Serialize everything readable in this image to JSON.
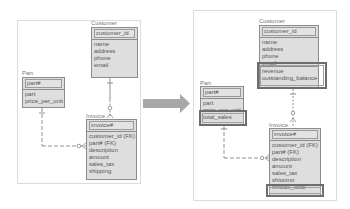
{
  "before": {
    "customer": {
      "title": "Customer",
      "key": "customer_id",
      "attrs": [
        "name",
        "address",
        "phone",
        "email"
      ]
    },
    "part": {
      "title": "Part",
      "key": "part#",
      "attrs": [
        "part",
        "price_per_unit"
      ]
    },
    "invoice": {
      "title": "Invoice",
      "key": "invoice#",
      "attrs": [
        "customer_id (FK)",
        "part# (FK)",
        "description",
        "amount",
        "sales_tax",
        "shipping"
      ]
    }
  },
  "after": {
    "customer": {
      "title": "Customer",
      "key": "customer_id",
      "attrs": [
        "name",
        "address",
        "phone",
        "email",
        "revenue",
        "outstanding_balance"
      ],
      "highlighted": [
        "revenue",
        "outstanding_balance"
      ]
    },
    "part": {
      "title": "Part",
      "key": "part#",
      "attrs": [
        "part",
        "price_per_unit",
        "total_sales"
      ],
      "highlighted": [
        "total_sales"
      ]
    },
    "invoice": {
      "title": "Invoice",
      "key": "invoice#",
      "attrs": [
        "customer_id (FK)",
        "part# (FK)",
        "description",
        "amount",
        "sales_tax",
        "shipping",
        "invoice_total"
      ],
      "highlighted": [
        "invoice_total"
      ]
    }
  },
  "arrow": {
    "icon": "right-arrow-icon",
    "color": "#a8a8a8"
  },
  "colors": {
    "entity_fill": "#dedede",
    "entity_border": "#8c8c8c",
    "highlight_border": "#6d6d6d"
  }
}
